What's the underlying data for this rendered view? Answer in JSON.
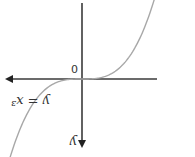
{
  "chart_data": {
    "type": "line",
    "title": "",
    "function": "y = x^3",
    "equation_label": "y = x³",
    "xlabel": "x",
    "ylabel": "y",
    "origin_label": "0",
    "xlim": [
      -1.35,
      1.35
    ],
    "ylim": [
      -2.0,
      2.0
    ],
    "grid": false,
    "orientation": "rotated 180°",
    "x": [
      -1.2,
      -1.0,
      -0.8,
      -0.6,
      -0.4,
      -0.2,
      0,
      0.2,
      0.4,
      0.6,
      0.8,
      1.0,
      1.2
    ],
    "series": [
      {
        "name": "y = x³",
        "color": "#a8a8a8"
      }
    ]
  }
}
